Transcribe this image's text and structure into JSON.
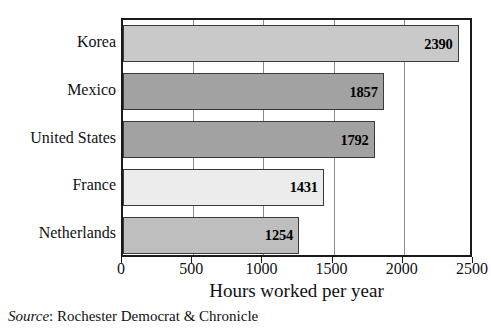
{
  "chart_data": {
    "type": "bar",
    "orientation": "horizontal",
    "title": "",
    "xlabel": "Hours worked per year",
    "ylabel": "",
    "xlim": [
      0,
      2500
    ],
    "ylim": null,
    "grid": true,
    "legend": false,
    "categories": [
      "Korea",
      "Mexico",
      "United States",
      "France",
      "Netherlands"
    ],
    "values": [
      2390,
      1857,
      1792,
      1431,
      1254
    ],
    "value_labels": [
      "2390",
      "1857",
      "1792",
      "1431",
      "1254"
    ],
    "bar_colors": [
      "#c9c9c9",
      "#a2a2a2",
      "#a2a2a2",
      "#ececec",
      "#bebebe"
    ],
    "xticks": [
      0,
      500,
      1000,
      1500,
      2000,
      2500
    ],
    "xtick_labels": [
      "0",
      "500",
      "1000",
      "1500",
      "2000",
      "2500"
    ],
    "source": {
      "label": "Source",
      "separator": ": ",
      "text": "Rochester Democrat & Chronicle"
    }
  },
  "axis": {
    "title": "Hours worked per year"
  },
  "colors": {
    "frame": "#1a1a1a",
    "gridline": "#8c8c8c",
    "bar_border": "#3a3a3a",
    "text": "#111111"
  }
}
